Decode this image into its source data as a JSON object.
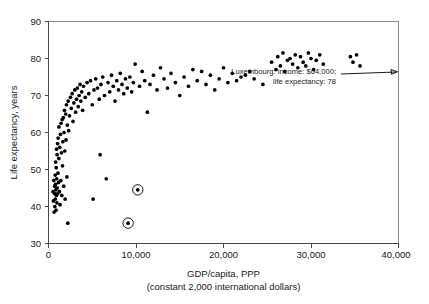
{
  "chart_data": {
    "type": "scatter",
    "title": "",
    "xlabel": "GDP/capita, PPP",
    "xlabel_sub": "(constant 2,000 international dollars)",
    "ylabel": "Life expectancy, years",
    "xlim": [
      0,
      40000
    ],
    "ylim": [
      30,
      90
    ],
    "xticks": [
      0,
      10000,
      20000,
      30000,
      40000
    ],
    "xticklabels": [
      "0",
      "10,000",
      "20,000",
      "30,000",
      "40,000"
    ],
    "yticks": [
      30,
      40,
      50,
      60,
      70,
      80,
      90
    ],
    "yticklabels": [
      "30",
      "40",
      "50",
      "60",
      "70",
      "80",
      "90"
    ],
    "grid": false,
    "legend": "none",
    "marker_color": "#000000",
    "frame_color": "#8d8d8d",
    "axis_color": "#4a4a4a",
    "points": [
      [
        520,
        44.0
      ],
      [
        560,
        41.5
      ],
      [
        600,
        47.0
      ],
      [
        640,
        38.5
      ],
      [
        680,
        43.5
      ],
      [
        700,
        45.5
      ],
      [
        720,
        40.0
      ],
      [
        760,
        48.5
      ],
      [
        780,
        42.0
      ],
      [
        800,
        46.0
      ],
      [
        820,
        52.0
      ],
      [
        840,
        44.5
      ],
      [
        860,
        39.0
      ],
      [
        880,
        50.5
      ],
      [
        900,
        43.0
      ],
      [
        920,
        55.5
      ],
      [
        940,
        47.5
      ],
      [
        960,
        41.0
      ],
      [
        980,
        54.0
      ],
      [
        1000,
        45.0
      ],
      [
        1040,
        57.0
      ],
      [
        1060,
        43.5
      ],
      [
        1080,
        49.0
      ],
      [
        1100,
        58.5
      ],
      [
        1140,
        46.5
      ],
      [
        1180,
        53.0
      ],
      [
        1200,
        61.5
      ],
      [
        1240,
        44.0
      ],
      [
        1280,
        56.0
      ],
      [
        1320,
        40.5
      ],
      [
        1360,
        59.5
      ],
      [
        1400,
        47.0
      ],
      [
        1440,
        62.5
      ],
      [
        1480,
        54.5
      ],
      [
        1520,
        43.0
      ],
      [
        1560,
        63.5
      ],
      [
        1600,
        51.0
      ],
      [
        1640,
        57.5
      ],
      [
        1700,
        64.0
      ],
      [
        1740,
        45.5
      ],
      [
        1780,
        60.0
      ],
      [
        1820,
        66.0
      ],
      [
        1860,
        55.0
      ],
      [
        1900,
        42.0
      ],
      [
        1960,
        65.0
      ],
      [
        2000,
        58.0
      ],
      [
        2050,
        67.5
      ],
      [
        2100,
        48.0
      ],
      [
        2150,
        62.0
      ],
      [
        2200,
        35.5
      ],
      [
        2250,
        68.5
      ],
      [
        2300,
        60.5
      ],
      [
        2400,
        64.5
      ],
      [
        2500,
        69.5
      ],
      [
        2600,
        66.5
      ],
      [
        2700,
        70.5
      ],
      [
        2800,
        63.0
      ],
      [
        2900,
        68.0
      ],
      [
        3000,
        71.5
      ],
      [
        3100,
        65.5
      ],
      [
        3200,
        69.0
      ],
      [
        3300,
        72.0
      ],
      [
        3400,
        67.0
      ],
      [
        3500,
        70.0
      ],
      [
        3600,
        73.0
      ],
      [
        3700,
        68.5
      ],
      [
        3800,
        71.0
      ],
      [
        3900,
        66.0
      ],
      [
        4000,
        72.5
      ],
      [
        4200,
        69.5
      ],
      [
        4400,
        73.5
      ],
      [
        4600,
        70.5
      ],
      [
        4800,
        74.0
      ],
      [
        5000,
        67.5
      ],
      [
        5100,
        42.0
      ],
      [
        5200,
        71.5
      ],
      [
        5400,
        74.5
      ],
      [
        5600,
        72.0
      ],
      [
        5800,
        69.0
      ],
      [
        5900,
        54.0
      ],
      [
        6000,
        73.0
      ],
      [
        6200,
        75.0
      ],
      [
        6400,
        70.0
      ],
      [
        6600,
        47.5
      ],
      [
        6800,
        73.5
      ],
      [
        7000,
        71.0
      ],
      [
        7200,
        75.5
      ],
      [
        7400,
        72.5
      ],
      [
        7600,
        68.5
      ],
      [
        7800,
        74.0
      ],
      [
        8000,
        71.5
      ],
      [
        8200,
        76.0
      ],
      [
        8400,
        73.0
      ],
      [
        8600,
        70.5
      ],
      [
        8800,
        74.5
      ],
      [
        9000,
        72.0
      ],
      [
        9100,
        35.5
      ],
      [
        9300,
        75.0
      ],
      [
        9500,
        71.0
      ],
      [
        9700,
        73.5
      ],
      [
        9900,
        78.5
      ],
      [
        10200,
        44.5
      ],
      [
        10400,
        72.5
      ],
      [
        10700,
        76.5
      ],
      [
        11000,
        74.0
      ],
      [
        11300,
        65.5
      ],
      [
        11600,
        73.0
      ],
      [
        12000,
        75.5
      ],
      [
        12400,
        71.5
      ],
      [
        12800,
        77.5
      ],
      [
        13200,
        74.5
      ],
      [
        13600,
        72.0
      ],
      [
        14000,
        76.0
      ],
      [
        14500,
        73.5
      ],
      [
        15000,
        70.0
      ],
      [
        15500,
        75.0
      ],
      [
        16000,
        72.5
      ],
      [
        16500,
        77.0
      ],
      [
        17000,
        74.0
      ],
      [
        17500,
        76.5
      ],
      [
        18000,
        73.0
      ],
      [
        18500,
        75.5
      ],
      [
        19000,
        71.5
      ],
      [
        19500,
        74.5
      ],
      [
        20000,
        77.5
      ],
      [
        20500,
        73.5
      ],
      [
        21000,
        76.0
      ],
      [
        21500,
        74.0
      ],
      [
        22000,
        75.0
      ],
      [
        22500,
        75.5
      ],
      [
        23000,
        76.5
      ],
      [
        23500,
        74.5
      ],
      [
        24500,
        73.0
      ],
      [
        25500,
        79.0
      ],
      [
        26000,
        77.0
      ],
      [
        26200,
        80.5
      ],
      [
        26500,
        78.0
      ],
      [
        26800,
        81.5
      ],
      [
        27000,
        76.5
      ],
      [
        27300,
        79.5
      ],
      [
        27600,
        80.0
      ],
      [
        27900,
        78.5
      ],
      [
        28200,
        81.0
      ],
      [
        28500,
        77.5
      ],
      [
        28800,
        80.5
      ],
      [
        29100,
        79.0
      ],
      [
        29400,
        78.0
      ],
      [
        29700,
        81.5
      ],
      [
        30000,
        80.0
      ],
      [
        30300,
        77.0
      ],
      [
        30600,
        79.5
      ],
      [
        31000,
        81.0
      ],
      [
        31400,
        78.5
      ],
      [
        34500,
        80.5
      ],
      [
        34800,
        79.0
      ],
      [
        35200,
        81.0
      ],
      [
        35600,
        78.0
      ]
    ],
    "highlighted_points": [
      {
        "x": 10200,
        "y": 44.5,
        "style": "circled"
      },
      {
        "x": 9100,
        "y": 35.5,
        "style": "circled"
      }
    ],
    "annotations": [
      {
        "line1": "Luxembourg: income: $64,000;",
        "line2": "life expectancy: 78",
        "arrow": "points-right-to-plot-edge"
      }
    ]
  }
}
